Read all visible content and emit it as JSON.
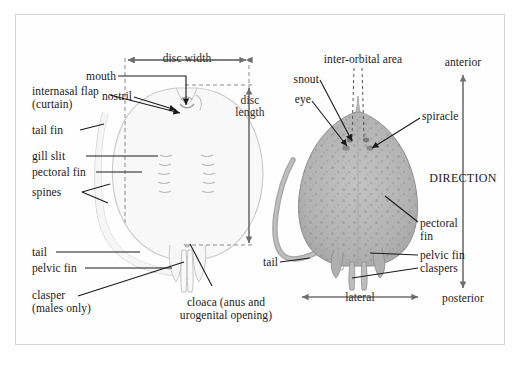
{
  "figure": {
    "background_color": "#ffffff",
    "frame_color": "#d4d4d4",
    "text_color": "#1a1a1a",
    "left_specimen_fill": "#f7f7f7",
    "left_specimen_stroke": "#c9c9c9",
    "right_specimen_fill": "#b4b4b4",
    "right_specimen_stroke": "#8e8e8e",
    "leader_line_color": "#1a1a1a",
    "dimension_line_color": "#6e6e6e",
    "dashed_guide_color": "#8a8a8a"
  },
  "ventral_view": {
    "view_name": "ventral-view",
    "labels": {
      "disc_width": "disc width",
      "mouth": "mouth",
      "nostril": "nostril",
      "internasal_flap_line1": "internasal flap",
      "internasal_flap_line2": "(curtain)",
      "tail_fin": "tail fin",
      "gill_slit": "gill slit",
      "pectoral_fin": "pectoral fin",
      "spines": "spines",
      "tail": "tail",
      "pelvic_fin": "pelvic fin",
      "clasper_line1": "clasper",
      "clasper_line2": "(males only)",
      "disc_length_line1": "disc",
      "disc_length_line2": "length",
      "cloaca_line1": "cloaca (anus and",
      "cloaca_line2": "urogenital opening)"
    }
  },
  "dorsal_view": {
    "view_name": "dorsal-view",
    "labels": {
      "inter_orbital_area": "inter-orbital area",
      "snout": "snout",
      "eye": "eye",
      "spiracle": "spiracle",
      "pectoral_fin_line1": "pectoral",
      "pectoral_fin_line2": "fin",
      "pelvic_fin": "pelvic fin",
      "claspers": "claspers",
      "tail": "tail",
      "lateral": "lateral"
    }
  },
  "orientation": {
    "anterior": "anterior",
    "posterior": "posterior",
    "direction": "DIRECTION"
  }
}
